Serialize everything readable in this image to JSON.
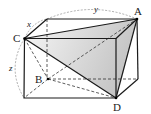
{
  "diagram": {
    "type": "rectangular-prism",
    "points": {
      "A": {
        "label": "A",
        "x": 137,
        "y": 19
      },
      "B": {
        "label": "B",
        "x": 48,
        "y": 79
      },
      "C": {
        "label": "C",
        "x": 24.5,
        "y": 38.5
      },
      "D": {
        "label": "D",
        "x": 116,
        "y": 98
      }
    },
    "edge_labels": {
      "x": "x",
      "y": "y",
      "z": "z"
    },
    "colors": {
      "stroke": "#1a1a1a",
      "dashed": "#333333",
      "arc": "#888888",
      "shade_light": "#f4f4f4",
      "shade_dark": "#c8c8c8"
    }
  }
}
